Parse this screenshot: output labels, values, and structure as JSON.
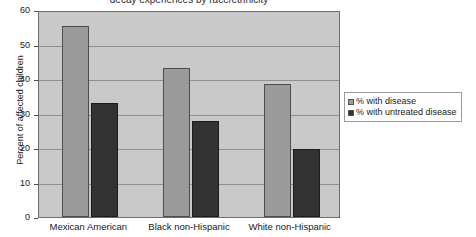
{
  "chart_data": {
    "type": "bar",
    "title": "decay experiences by race/ethnicity",
    "xlabel": "",
    "ylabel": "Percent of affected children",
    "categories": [
      "Mexican American",
      "Black non-Hispanic",
      "White non-Hispanic"
    ],
    "series": [
      {
        "name": "% with disease",
        "color": "#9b9b9b",
        "values": [
          55.5,
          43.3,
          38.5
        ]
      },
      {
        "name": "% with untreated disease",
        "color": "#333333",
        "values": [
          33.0,
          27.8,
          19.8
        ]
      }
    ],
    "ylim": [
      0,
      60
    ],
    "yticks": [
      0,
      10,
      20,
      30,
      40,
      50,
      60
    ],
    "ytick_labels": [
      "0",
      "10",
      "20",
      "30",
      "40",
      "50",
      "60"
    ],
    "grid": true,
    "legend_position": "right",
    "plot_background": "#c9c9c9"
  }
}
